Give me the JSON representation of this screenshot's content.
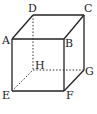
{
  "diagram": {
    "type": "cube",
    "vertices": {
      "A": {
        "label": "A",
        "x": 12,
        "y": 39
      },
      "B": {
        "label": "B",
        "x": 64,
        "y": 39
      },
      "C": {
        "label": "C",
        "x": 84,
        "y": 15
      },
      "D": {
        "label": "D",
        "x": 33,
        "y": 15
      },
      "E": {
        "label": "E",
        "x": 12,
        "y": 91
      },
      "F": {
        "label": "F",
        "x": 64,
        "y": 91
      },
      "G": {
        "label": "G",
        "x": 84,
        "y": 70
      },
      "H": {
        "label": "H",
        "x": 33,
        "y": 70
      }
    },
    "hidden_edges": [
      "DH",
      "EH",
      "HG"
    ],
    "visible_edges": [
      "AB",
      "BC",
      "CD",
      "DA",
      "AE",
      "BF",
      "CG",
      "EF",
      "FG"
    ]
  }
}
